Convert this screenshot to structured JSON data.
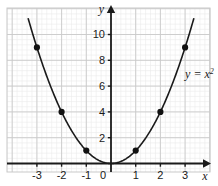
{
  "chart_data": {
    "type": "line",
    "title": "",
    "subtitle": "",
    "xlabel": "x",
    "ylabel": "y",
    "xlim": [
      -3.6,
      3.6
    ],
    "ylim": [
      -0.8,
      11.2
    ],
    "xticks": [
      -3,
      -2,
      -1,
      0,
      1,
      2,
      3
    ],
    "xtick_labels": [
      "-3",
      "-2",
      "-1",
      "0",
      "1",
      "2",
      "3"
    ],
    "yticks": [
      2,
      4,
      6,
      8,
      10
    ],
    "ytick_labels": [
      "2",
      "4",
      "6",
      "8",
      "10"
    ],
    "grid": true,
    "grid_major_step_x": 1,
    "grid_major_step_y": 2,
    "grid_minor_divisions": 5,
    "legend": "none",
    "annotation": {
      "text_base": "y = x",
      "text_exponent": "2",
      "x": 3.0,
      "y": 6.6
    },
    "series": [
      {
        "name": "y = x^2",
        "equation": "y = x^2",
        "color": "#1a1a1a",
        "marker": "filled-circle",
        "x": [
          -3,
          -2,
          -1,
          0,
          1,
          2,
          3
        ],
        "values": [
          9,
          4,
          1,
          0,
          1,
          4,
          9
        ]
      }
    ],
    "curve_x_range": [
      -3.35,
      3.35
    ],
    "colors": {
      "curve": "#1a1a1a",
      "marker": "#111111",
      "axis": "#1a1a1a",
      "grid_major": "#c9c9c9",
      "grid_minor": "#ebebeb",
      "background": "#ffffff",
      "plot_border": "#c9c9c9"
    }
  }
}
